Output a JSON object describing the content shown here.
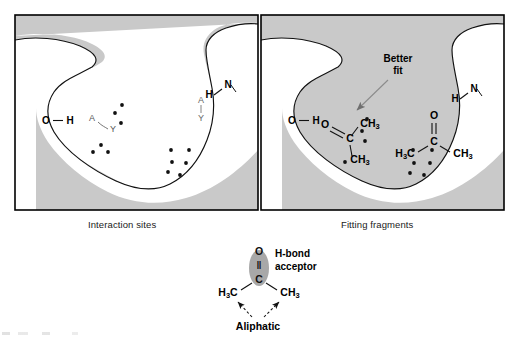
{
  "figure": {
    "panels": [
      {
        "id": "interaction-sites",
        "caption": "Interaction sites",
        "labels": {
          "donor_left": "O",
          "donor_left_h": "H",
          "acceptor_left_a": "A",
          "acceptor_left_y": "Y",
          "acceptor_right_a": "A",
          "acceptor_right_y": "Y",
          "donor_right_h": "H",
          "donor_right_n": "N"
        }
      },
      {
        "id": "fitting-fragments",
        "caption": "Fitting fragments",
        "annotation": {
          "line1": "Better",
          "line2": "fit"
        },
        "labels": {
          "donor_left": "O",
          "donor_left_h": "H",
          "donor_right_h": "H",
          "donor_right_n": "N"
        },
        "fragments": [
          {
            "name": "acetone-fitted",
            "oxygen": "O",
            "carbonyl_carbon": "C",
            "methyl_upper": "CH",
            "methyl_upper_sub": "3",
            "methyl_lower": "CH",
            "methyl_lower_sub": "3"
          },
          {
            "name": "acetone-unfitted",
            "oxygen": "O",
            "carbonyl_carbon": "C",
            "methyl_left": "H",
            "methyl_left_sub": "3",
            "methyl_left_c": "C",
            "methyl_right": "CH",
            "methyl_right_sub": "3"
          }
        ]
      }
    ],
    "legend": {
      "molecule": {
        "oxygen": "O",
        "double_bond": "‖",
        "carbon": "C",
        "methyl_left": "H",
        "methyl_left_sub": "3",
        "methyl_left_c": "C",
        "methyl_right": "CH",
        "methyl_right_sub": "3"
      },
      "hbond_label_line1": "H-bond",
      "hbond_label_line2": "acceptor",
      "aliphatic_label": "Aliphatic"
    },
    "colors": {
      "protein_fill": "#c9c9c9",
      "pocket_fill": "#ffffff",
      "outline": "#000000",
      "dot": "#111111",
      "highlight_ellipse": "#a6a6a6",
      "arrow_gray": "#8c8c8c",
      "frame": "#000000"
    }
  }
}
